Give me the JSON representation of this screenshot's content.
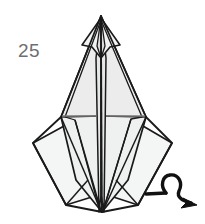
{
  "figure": {
    "kind": "origami-folding-diagram",
    "step_label": "25",
    "width": 205,
    "height": 224,
    "background_color": "#ffffff",
    "outline_color": "#1a1a1a",
    "crease_color": "#7a7a7a",
    "step_number_color": "#6f6f6f",
    "paper_fill_front": "#eceded",
    "paper_fill_back": "#f6f7f7",
    "paper_fill_wing": "#f2f3f3"
  },
  "model": {
    "name": "kite-base-with-spread-flaps",
    "apex_top": {
      "x": 101,
      "y": 16
    },
    "apex_bottom": {
      "x": 102,
      "y": 212
    },
    "corner_left": {
      "x": 33,
      "y": 143
    },
    "corner_right": {
      "x": 172,
      "y": 143
    },
    "waist_left": {
      "x": 62,
      "y": 116
    },
    "waist_right": {
      "x": 145,
      "y": 116
    },
    "horizontal_crease": {
      "y": 116,
      "x_start": 62,
      "x_end": 145,
      "gap_center_x": 101
    }
  },
  "annotations": {
    "turn_over_arrow": {
      "name": "turn-over-arrow",
      "description": "looped turn-the-model-over arrow",
      "tail_start": {
        "x": 146,
        "y": 194
      },
      "loop_center": {
        "x": 172,
        "y": 187
      },
      "head_tip": {
        "x": 196,
        "y": 204
      },
      "color": "#111111"
    }
  }
}
